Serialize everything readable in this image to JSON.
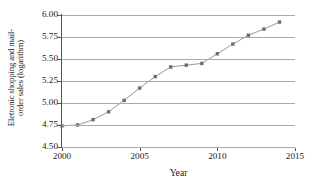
{
  "chart_data": {
    "type": "line",
    "title": "",
    "xlabel": "Year",
    "ylabel_line1": "Eletronic shopping and mail-",
    "ylabel_line2": "order sales (logarithm)",
    "x": [
      2000,
      2001,
      2002,
      2003,
      2004,
      2005,
      2006,
      2007,
      2008,
      2009,
      2010,
      2011,
      2012,
      2013,
      2014
    ],
    "values": [
      4.74,
      4.75,
      4.81,
      4.9,
      5.03,
      5.17,
      5.3,
      5.41,
      5.43,
      5.45,
      5.56,
      5.67,
      5.77,
      5.84,
      5.92
    ],
    "series": [
      {
        "name": "Eletronic shopping and mail-order sales (logarithm)",
        "values": [
          4.74,
          4.75,
          4.81,
          4.9,
          5.03,
          5.17,
          5.3,
          5.41,
          5.43,
          5.45,
          5.56,
          5.67,
          5.77,
          5.84,
          5.92
        ]
      }
    ],
    "xlim": [
      2000,
      2015
    ],
    "ylim": [
      4.5,
      6.0
    ],
    "xticks": [
      2000,
      2005,
      2010,
      2015
    ],
    "xtick_labels": [
      "2000",
      "2005",
      "2010",
      "2015"
    ],
    "yticks": [
      4.5,
      4.75,
      5.0,
      5.25,
      5.5,
      5.75,
      6.0
    ],
    "ytick_labels": [
      "4.50",
      "4.75",
      "5.00",
      "5.25",
      "5.50",
      "5.75",
      "6.00"
    ],
    "grid": true,
    "grid_axis": "y",
    "legend": false,
    "legend_position": "none",
    "line_color": "#9a9a9a",
    "marker_color": "#6e6e6e",
    "marker": "square",
    "axis_color": "#555555",
    "grid_color": "#aaaaaa",
    "background_color": "#ffffff"
  }
}
